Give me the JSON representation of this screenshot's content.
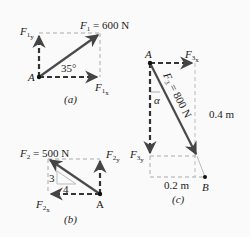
{
  "panels": {
    "a": {
      "caption": "(a)",
      "force_label": "F",
      "force_sub": "1",
      "force_value": "= 600 N",
      "angle": "35°",
      "point": "A",
      "comp_x": {
        "main": "F",
        "sub1": "1",
        "sub2": "x"
      },
      "comp_y": {
        "main": "F",
        "sub1": "1",
        "sub2": "y"
      }
    },
    "b": {
      "caption": "(b)",
      "force_label": "F",
      "force_sub": "2",
      "force_value": "= 500 N",
      "slope_rise": "3",
      "slope_run": "4",
      "point": "A",
      "comp_x": {
        "main": "F",
        "sub1": "2",
        "sub2": "x"
      },
      "comp_y": {
        "main": "F",
        "sub1": "2",
        "sub2": "y"
      }
    },
    "c": {
      "caption": "(c)",
      "force_label": "F",
      "force_sub": "3",
      "force_value": "= 800 N",
      "angle": "α",
      "point_a": "A",
      "point_b": "B",
      "dim_vertical": "0.4 m",
      "dim_horizontal": "0.2 m",
      "comp_x": {
        "main": "F",
        "sub1": "3",
        "sub2": "x"
      },
      "comp_y": {
        "main": "F",
        "sub1": "3",
        "sub2": "y"
      }
    }
  },
  "colors": {
    "vector": "#4a4a4a",
    "dashed": "#3a3a3a",
    "guide": "#b8b8b8"
  }
}
